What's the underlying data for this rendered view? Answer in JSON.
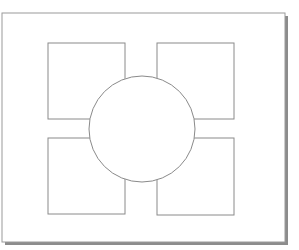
{
  "diagram": {
    "background": "#ffffff",
    "frame": {
      "x": 2,
      "y": 13,
      "width": 283,
      "height": 229,
      "stroke": "#9a9a9a",
      "shadow_color": "#8c8c8c"
    },
    "stroke_color": "#8a8a8a",
    "boxes": [
      {
        "id": "top-left",
        "x": 48,
        "y": 43,
        "width": 77,
        "height": 76
      },
      {
        "id": "top-right",
        "x": 157,
        "y": 43,
        "width": 77,
        "height": 76
      },
      {
        "id": "bottom-left",
        "x": 48,
        "y": 138,
        "width": 77,
        "height": 76
      },
      {
        "id": "bottom-right",
        "x": 157,
        "y": 138,
        "width": 77,
        "height": 77
      }
    ],
    "circle": {
      "cx": 142,
      "cy": 129,
      "r": 53
    }
  }
}
